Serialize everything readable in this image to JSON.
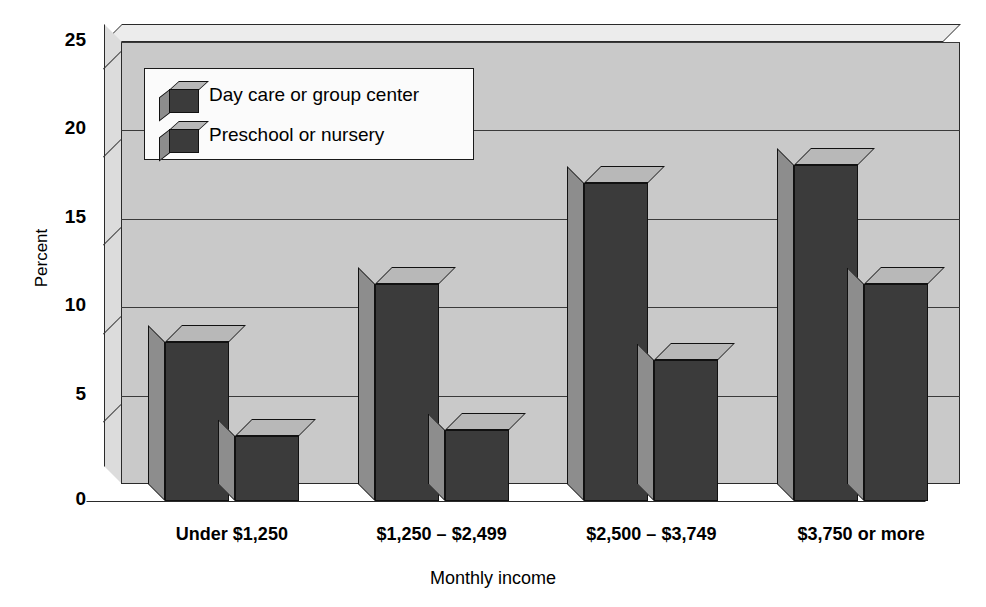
{
  "chart_data": {
    "type": "bar",
    "title": "",
    "xlabel": "Monthly income",
    "ylabel": "Percent",
    "ylim": [
      0,
      25
    ],
    "yticks": [
      "0",
      "5",
      "10",
      "15",
      "20",
      "25"
    ],
    "ytick_values": [
      0,
      5,
      10,
      15,
      20,
      25
    ],
    "grid": true,
    "legend_position": "top-left inside plot",
    "style": "3d-bar",
    "categories": [
      "Under $1,250",
      "$1,250 – $2,499",
      "$2,500 – $3,749",
      "$3,750 or more"
    ],
    "series": [
      {
        "name": "Day care or group center",
        "values": [
          9.0,
          12.3,
          18.0,
          19.0
        ]
      },
      {
        "name": "Preschool or nursery",
        "values": [
          3.7,
          4.0,
          8.0,
          12.3
        ]
      }
    ]
  },
  "legend": {
    "items": [
      {
        "label": "Day care or group center",
        "swatch": "cube-3d-icon"
      },
      {
        "label": "Preschool or nursery",
        "swatch": "cube-3d-icon"
      }
    ]
  },
  "colors": {
    "bar_front": "#3b3b3b",
    "bar_side": "#8d8d8d",
    "bar_top": "#b8b8b8",
    "wall_back": "#c9c9c9",
    "wall_left": "#dcdcdc",
    "wall_top": "#ececec",
    "legend_bg": "#fbfbfb",
    "outline": "#111111",
    "page_bg": "#ffffff"
  }
}
